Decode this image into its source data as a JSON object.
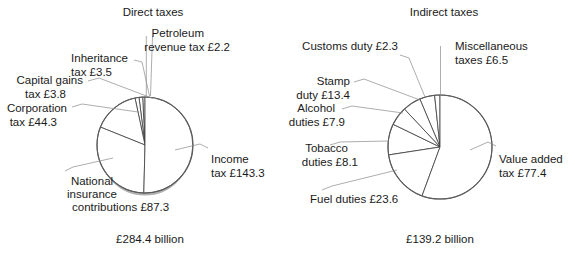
{
  "figure": {
    "currency_symbol": "£",
    "unit": "billion"
  },
  "charts": [
    {
      "id": "direct-taxes",
      "title": "Direct taxes",
      "total_label": "£284.4 billion",
      "total": 284.4,
      "labels": [
        {
          "key": "petroleum",
          "text_lines": [
            "Petroleum",
            "revenue tax £2.2"
          ]
        },
        {
          "key": "inheritance",
          "text_lines": [
            "Inheritance",
            "tax £3.5"
          ]
        },
        {
          "key": "capital-gains",
          "text_lines": [
            "Capital gains",
            "tax £3.8"
          ]
        },
        {
          "key": "corporation",
          "text_lines": [
            "Corporation",
            "tax £44.3"
          ]
        },
        {
          "key": "national-insurance",
          "text_lines": [
            "National",
            "insurance",
            "contributions £87.3"
          ]
        },
        {
          "key": "income",
          "text_lines": [
            "Income",
            "tax £143.3"
          ]
        }
      ]
    },
    {
      "id": "indirect-taxes",
      "title": "Indirect taxes",
      "total_label": "£139.2 billion",
      "total": 139.2,
      "labels": [
        {
          "key": "customs",
          "text_lines": [
            "Customs duty £2.3"
          ]
        },
        {
          "key": "miscellaneous",
          "text_lines": [
            "Miscellaneous",
            "taxes £6.5"
          ]
        },
        {
          "key": "stamp",
          "text_lines": [
            "Stamp",
            "duty £13.4"
          ]
        },
        {
          "key": "alcohol",
          "text_lines": [
            "Alcohol",
            "duties £7.9"
          ]
        },
        {
          "key": "tobacco",
          "text_lines": [
            "Tobacco",
            "duties £8.1"
          ]
        },
        {
          "key": "fuel",
          "text_lines": [
            "Fuel duties £23.6"
          ]
        },
        {
          "key": "vat",
          "text_lines": [
            "Value added",
            "tax £77.4"
          ]
        }
      ]
    }
  ],
  "chart_data": [
    {
      "type": "pie",
      "title": "Direct taxes",
      "subtitle": "£284.4 billion",
      "units": "£ billion",
      "total": 284.4,
      "legend_position": "callout-labels",
      "grid": false,
      "categories": [
        "Income tax",
        "National insurance contributions",
        "Corporation tax",
        "Capital gains tax",
        "Inheritance tax",
        "Petroleum revenue tax"
      ],
      "values": [
        143.3,
        87.3,
        44.3,
        3.8,
        3.5,
        2.2
      ],
      "value_labels": [
        "£143.3",
        "£87.3",
        "£44.3",
        "£3.8",
        "£3.5",
        "£2.2"
      ],
      "percentages": [
        50.4,
        30.7,
        15.6,
        1.3,
        1.2,
        0.8
      ],
      "start_angle_deg": 0,
      "direction": "clockwise",
      "colors": [
        "#ffffff",
        "#ffffff",
        "#ffffff",
        "#ffffff",
        "#ffffff",
        "#ffffff"
      ],
      "stroke": "#3c3c3c"
    },
    {
      "type": "pie",
      "title": "Indirect taxes",
      "subtitle": "£139.2 billion",
      "units": "£ billion",
      "total": 139.2,
      "legend_position": "callout-labels",
      "grid": false,
      "categories": [
        "Value added tax",
        "Fuel duties",
        "Stamp duty",
        "Tobacco duties",
        "Alcohol duties",
        "Miscellaneous taxes",
        "Customs duty"
      ],
      "values": [
        77.4,
        23.6,
        13.4,
        8.1,
        7.9,
        6.5,
        2.3
      ],
      "value_labels": [
        "£77.4",
        "£23.6",
        "£13.4",
        "£8.1",
        "£7.9",
        "£6.5",
        "£2.3"
      ],
      "percentages": [
        55.6,
        17.0,
        9.6,
        5.8,
        5.7,
        4.7,
        1.7
      ],
      "start_angle_deg": 0,
      "direction": "clockwise",
      "colors": [
        "#ffffff",
        "#ffffff",
        "#ffffff",
        "#ffffff",
        "#ffffff",
        "#ffffff",
        "#ffffff"
      ],
      "stroke": "#3c3c3c"
    }
  ]
}
